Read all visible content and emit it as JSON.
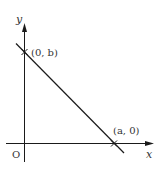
{
  "diagram": {
    "axes": {
      "x_label": "x",
      "y_label": "y",
      "origin_label": "O"
    },
    "points": [
      {
        "label": "(0, b)"
      },
      {
        "label": "(a, 0)"
      }
    ],
    "colors": {
      "stroke": "#1a1a1a",
      "text": "#333333"
    }
  }
}
